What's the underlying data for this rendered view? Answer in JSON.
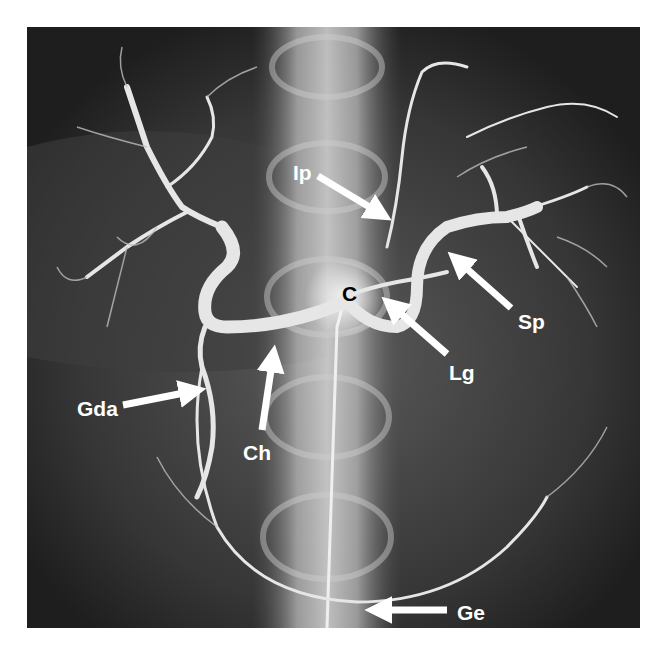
{
  "figure": {
    "type": "angiogram",
    "colors": {
      "background": "#ffffff",
      "image_dark": "#2a2a2a",
      "vessel": "#e8e8e8",
      "label": "#ffffff",
      "label_dark": "#000000",
      "arrow": "#ffffff"
    }
  },
  "labels": [
    {
      "id": "ip",
      "text": "Ip",
      "meaning": "inferior phrenic artery"
    },
    {
      "id": "c",
      "text": "C",
      "meaning": "celiac trunk"
    },
    {
      "id": "sp",
      "text": "Sp",
      "meaning": "splenic artery"
    },
    {
      "id": "lg",
      "text": "Lg",
      "meaning": "left gastric artery"
    },
    {
      "id": "gda",
      "text": "Gda",
      "meaning": "gastroduodenal artery"
    },
    {
      "id": "ch",
      "text": "Ch",
      "meaning": "common hepatic artery"
    },
    {
      "id": "ge",
      "text": "Ge",
      "meaning": "gastroepiploic artery"
    }
  ]
}
